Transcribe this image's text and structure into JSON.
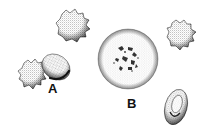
{
  "figure": {
    "labels": {
      "a": "A",
      "b": "B"
    },
    "cells": [
      {
        "id": "crenated-top",
        "kind": "crenated"
      },
      {
        "id": "crenated-a",
        "kind": "crenated"
      },
      {
        "id": "oval-a",
        "kind": "smooth-oval"
      },
      {
        "id": "large-b",
        "kind": "large-round-with-inclusions"
      },
      {
        "id": "crenated-right",
        "kind": "crenated"
      },
      {
        "id": "biconcave-bottom-right",
        "kind": "biconcave"
      }
    ],
    "colors": {
      "stipple": "#555555",
      "outline": "#222222",
      "background": "#ffffff"
    }
  }
}
